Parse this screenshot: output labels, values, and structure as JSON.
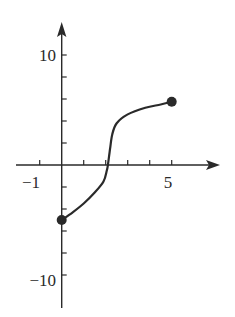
{
  "chart_data": {
    "type": "line",
    "title": "",
    "xlabel": "",
    "ylabel": "",
    "xlim": [
      -2,
      7
    ],
    "ylim": [
      -12,
      12
    ],
    "grid": false,
    "legend": null,
    "x_ticks": [
      -1,
      0,
      1,
      2,
      3,
      4,
      5
    ],
    "y_ticks": [
      -10,
      -8,
      -6,
      -4,
      -2,
      0,
      2,
      4,
      6,
      8,
      10
    ],
    "x_tick_labels": [
      {
        "value": -1,
        "label": "−1"
      },
      {
        "value": 5,
        "label": "5"
      }
    ],
    "y_tick_labels": [
      {
        "value": 10,
        "label": "10"
      },
      {
        "value": -10,
        "label": "−10"
      }
    ],
    "series": [
      {
        "name": "f(x)",
        "x": [
          0,
          0.5,
          1,
          1.5,
          1.9,
          2.05,
          2.1,
          2.2,
          2.3,
          2.5,
          3.0,
          3.8,
          4.5,
          5.0
        ],
        "y": [
          -5,
          -4.3,
          -3.5,
          -2.5,
          -1.5,
          -0.5,
          0,
          1.5,
          2.8,
          3.8,
          4.6,
          5.2,
          5.5,
          5.75
        ],
        "closed_endpoints": [
          {
            "x": 0,
            "y": -5
          },
          {
            "x": 5,
            "y": 5.75
          }
        ]
      }
    ],
    "annotations": []
  },
  "axes": {
    "x_label_neg1": "−1",
    "x_label_5": "5",
    "y_label_10": "10",
    "y_label_neg10": "−10"
  },
  "colors": {
    "ink": "#2a2a2a",
    "background": "#ffffff"
  }
}
